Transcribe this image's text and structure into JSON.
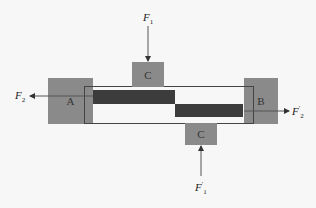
{
  "diagram": {
    "blocks": {
      "a": "A",
      "b": "B",
      "c_top": "C",
      "c_bottom": "C"
    },
    "forces": {
      "f1": {
        "symbol": "F",
        "sub": "1",
        "prime": ""
      },
      "f1_prime": {
        "symbol": "F",
        "sub": "1",
        "prime": "′"
      },
      "f2": {
        "symbol": "F",
        "sub": "2",
        "prime": ""
      },
      "f2_prime": {
        "symbol": "F",
        "sub": "2",
        "prime": "′"
      }
    },
    "colors": {
      "block": "#8a8a8a",
      "bar": "#3c3c3c",
      "line": "#444444",
      "background": "#f7f7f7"
    }
  }
}
